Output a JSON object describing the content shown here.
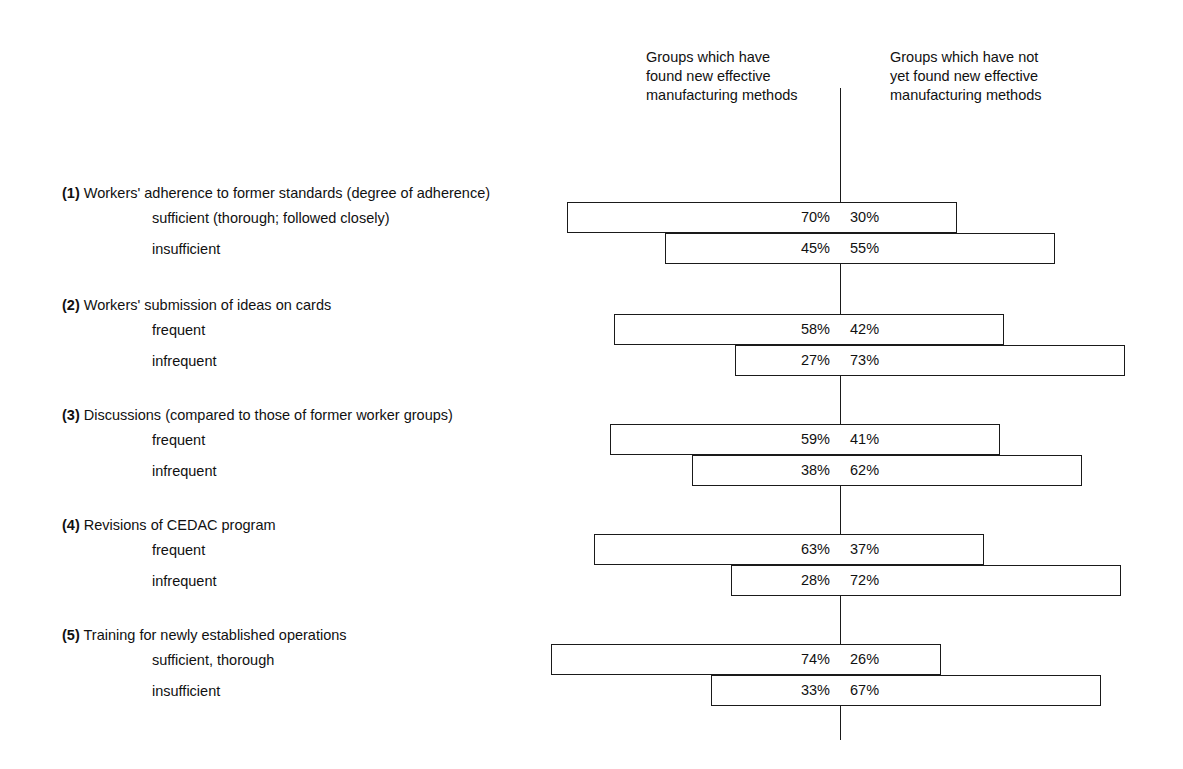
{
  "chart_data": {
    "type": "bar",
    "subtype": "diverging-stacked-bar",
    "title": "",
    "xlabel": "",
    "ylabel": "",
    "xlim": [
      0,
      100
    ],
    "grid": false,
    "legend_position": "top",
    "axis_center_label": "",
    "series": [
      {
        "name": "Groups which have found new effective manufacturing methods",
        "side": "left",
        "values": [
          70,
          45,
          58,
          27,
          59,
          38,
          63,
          28,
          74,
          33
        ]
      },
      {
        "name": "Groups which have not yet found new effective manufacturing methods",
        "side": "right",
        "values": [
          30,
          55,
          42,
          73,
          41,
          62,
          37,
          72,
          26,
          67
        ]
      }
    ],
    "categories": [
      "(1) sufficient (thorough; followed closely)",
      "(1) insufficient",
      "(2) frequent",
      "(2) infrequent",
      "(3) frequent",
      "(3) infrequent",
      "(4) frequent",
      "(4) infrequent",
      "(5) sufficient, thorough",
      "(5) insufficient"
    ]
  },
  "headers": {
    "left": "Groups which have\nfound new effective\nmanufacturing methods",
    "right": "Groups which have not\nyet found new effective\nmanufacturing methods"
  },
  "sections": [
    {
      "number": "(1)",
      "title": "Workers' adherence to former standards (degree of adherence)",
      "rows": [
        {
          "label": "sufficient (thorough; followed closely)",
          "left": "70%",
          "right": "30%",
          "left_value": 70,
          "right_value": 30
        },
        {
          "label": "insufficient",
          "left": "45%",
          "right": "55%",
          "left_value": 45,
          "right_value": 55
        }
      ]
    },
    {
      "number": "(2)",
      "title": "Workers' submission of ideas on cards",
      "rows": [
        {
          "label": "frequent",
          "left": "58%",
          "right": "42%",
          "left_value": 58,
          "right_value": 42
        },
        {
          "label": "infrequent",
          "left": "27%",
          "right": "73%",
          "left_value": 27,
          "right_value": 73
        }
      ]
    },
    {
      "number": "(3)",
      "title": "Discussions (compared to those of former worker groups)",
      "rows": [
        {
          "label": "frequent",
          "left": "59%",
          "right": "41%",
          "left_value": 59,
          "right_value": 41
        },
        {
          "label": "infrequent",
          "left": "38%",
          "right": "62%",
          "left_value": 38,
          "right_value": 62
        }
      ]
    },
    {
      "number": "(4)",
      "title": "Revisions of CEDAC program",
      "rows": [
        {
          "label": "frequent",
          "left": "63%",
          "right": "37%",
          "left_value": 63,
          "right_value": 37
        },
        {
          "label": "infrequent",
          "left": "28%",
          "right": "72%",
          "left_value": 28,
          "right_value": 72
        }
      ]
    },
    {
      "number": "(5)",
      "title": "Training for newly established operations",
      "rows": [
        {
          "label": "sufficient, thorough",
          "left": "74%",
          "right": "26%",
          "left_value": 74,
          "right_value": 26
        },
        {
          "label": "insufficient",
          "left": "33%",
          "right": "67%",
          "left_value": 33,
          "right_value": 67
        }
      ]
    }
  ],
  "colors": {
    "ink": "#1a1a1a",
    "background": "#ffffff",
    "bar_fill": "#ffffff"
  },
  "geometry": {
    "axis_x": 840,
    "px_per_percent": 3.9,
    "bar_height": 31,
    "section_tops": [
      184,
      296,
      406,
      516,
      626
    ]
  }
}
